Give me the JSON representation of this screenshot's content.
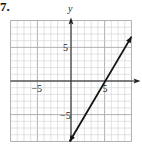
{
  "problem_number": "7.",
  "chart_data": {
    "type": "line",
    "title": "",
    "xlabel": "x",
    "ylabel": "y",
    "xlim": [
      -9,
      9
    ],
    "ylim": [
      -9,
      9
    ],
    "grid": true,
    "grid_step": 1,
    "major_step": 5,
    "x_tick_labels": [
      {
        "value": -5,
        "label": "−5"
      },
      {
        "value": 5,
        "label": "5"
      }
    ],
    "y_tick_labels": [
      {
        "value": 5,
        "label": "5"
      },
      {
        "value": -5,
        "label": "−5"
      }
    ],
    "series": [
      {
        "name": "line",
        "x": [
          -0.2,
          4.6,
          9.0
        ],
        "y": [
          -9.0,
          0,
          6.6
        ],
        "arrows": "both"
      }
    ]
  },
  "colors": {
    "grid_minor": "#d0d0d0",
    "grid_major": "#a8a8a8",
    "axis": "#222222",
    "line": "#111111"
  }
}
